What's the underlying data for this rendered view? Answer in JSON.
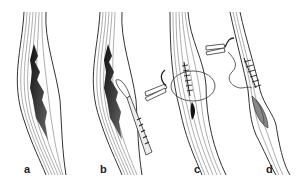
{
  "figure": {
    "panels": [
      {
        "id": "a",
        "label": "a",
        "content": "tendon with frayed longitudinal tear"
      },
      {
        "id": "b",
        "label": "b",
        "content": "tendon tear being debrided with scalpel"
      },
      {
        "id": "c",
        "label": "c",
        "content": "tendon sutured with needle holder, circular suture"
      },
      {
        "id": "d",
        "label": "d",
        "content": "tendon sutured with running suture, needle holder"
      }
    ],
    "colors": {
      "line": "#333333",
      "tear": "#2a2a2a",
      "background": "#ffffff"
    }
  }
}
